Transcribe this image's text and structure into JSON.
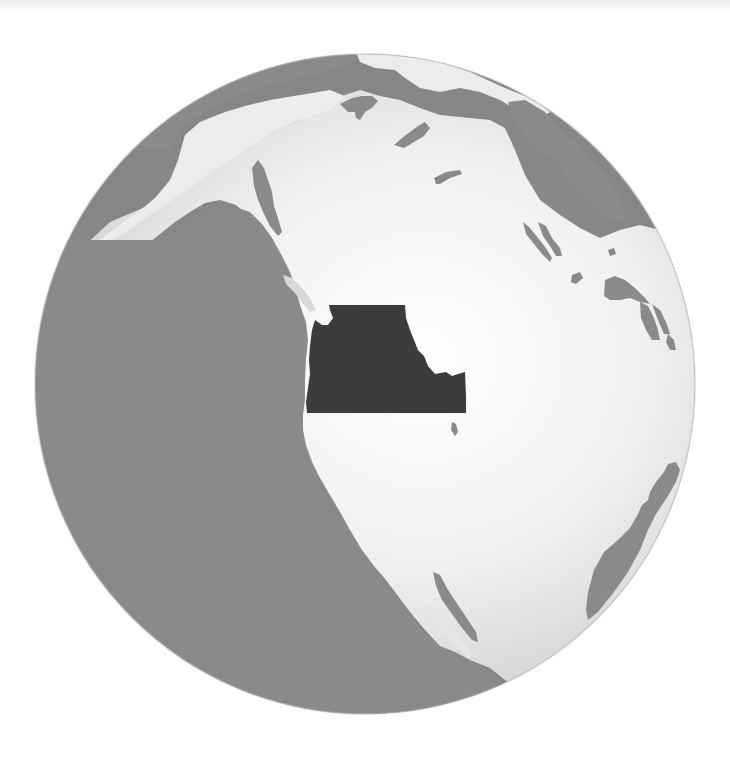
{
  "map": {
    "type": "locator-globe",
    "projection": "orthographic",
    "view_center": "western North America",
    "highlighted_region": {
      "name": "Pacific Northwest",
      "states": [
        "Washington",
        "Oregon",
        "Idaho"
      ]
    },
    "visible_features": [
      "North America",
      "Alaska",
      "Aleutian Islands",
      "Hudson Bay",
      "Great Bear Lake",
      "Great Slave Lake",
      "Lake Athabasca",
      "Lake Winnipeg",
      "Great Lakes",
      "Gulf of California",
      "Baja California",
      "South America (northern tip)",
      "Pacific Ocean"
    ]
  },
  "colors": {
    "background": "#ffffff",
    "ocean": "#8a8a8a",
    "land": "#f2f2f2",
    "land_shade": "#d2d2d2",
    "highlight": "#3c3c3c"
  }
}
